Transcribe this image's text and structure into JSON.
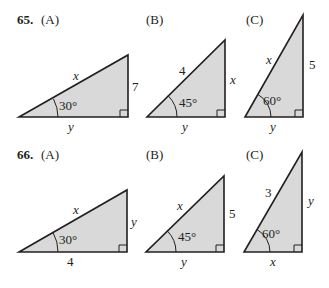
{
  "problems": [
    {
      "number": "65.",
      "parts": [
        {
          "label": "(A)",
          "angle": "30°",
          "hyp": "x",
          "opp": "7",
          "adj": "y"
        },
        {
          "label": "(B)",
          "angle": "45°",
          "hyp": "4",
          "opp": "x",
          "adj": "y"
        },
        {
          "label": "(C)",
          "angle": "60°",
          "hyp": "x",
          "opp": "5",
          "adj": "y"
        }
      ]
    },
    {
      "number": "66.",
      "parts": [
        {
          "label": "(A)",
          "angle": "30°",
          "hyp": "x",
          "opp": "y",
          "adj": "4"
        },
        {
          "label": "(B)",
          "angle": "45°",
          "hyp": "x",
          "opp": "5",
          "adj": "y"
        },
        {
          "label": "(C)",
          "angle": "60°",
          "hyp": "3",
          "opp": "y",
          "adj": "x"
        }
      ]
    }
  ],
  "colors": {
    "fill": "#d9d9d9",
    "stroke": "#231f20"
  }
}
